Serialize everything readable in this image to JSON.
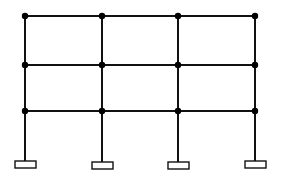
{
  "diagram": {
    "title": "",
    "type": "structural-frame",
    "colors": {
      "line": "#111111",
      "joint": "#000000",
      "footing_fill": "#ffffff",
      "background": "#ffffff"
    },
    "columns_x": [
      25,
      102,
      178,
      255
    ],
    "floors_y": [
      16,
      65,
      111
    ],
    "base_y": 161,
    "footings": [
      {
        "x": 15,
        "y": 161,
        "w": 21,
        "h": 7
      },
      {
        "x": 92,
        "y": 162,
        "w": 21,
        "h": 7
      },
      {
        "x": 168,
        "y": 162,
        "w": 21,
        "h": 7
      },
      {
        "x": 245,
        "y": 161,
        "w": 21,
        "h": 7
      }
    ],
    "bays": 3,
    "storeys": 3,
    "joint_count": 12
  }
}
